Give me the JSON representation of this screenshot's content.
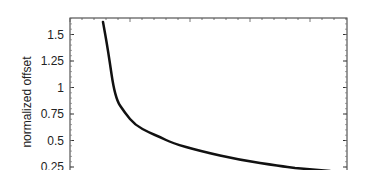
{
  "chart_data": {
    "type": "line",
    "title": "",
    "xlabel": "",
    "ylabel": "normalized offset",
    "ylim": [
      0.2,
      1.66
    ],
    "yticks": [
      "1.5",
      "1.25",
      "1",
      "0.75",
      "0.5",
      "0.25"
    ],
    "yticks_values": [
      1.5,
      1.25,
      1.0,
      0.75,
      0.5,
      0.25
    ],
    "grid": false,
    "legend": null,
    "series": [
      {
        "name": "normalized offset",
        "color": "#111111",
        "points_px": [
          [
            103,
            22
          ],
          [
            108,
            50
          ],
          [
            115,
            98
          ],
          [
            125,
            113
          ],
          [
            135,
            125
          ],
          [
            150,
            133
          ],
          [
            160,
            137
          ],
          [
            172,
            143
          ],
          [
            200,
            151
          ],
          [
            240,
            160
          ],
          [
            280,
            166
          ],
          [
            295,
            168
          ]
        ],
        "values": [
          1.62,
          1.36,
          0.91,
          0.77,
          0.66,
          0.58,
          0.55,
          0.49,
          0.42,
          0.33,
          0.28,
          0.26
        ]
      }
    ]
  }
}
